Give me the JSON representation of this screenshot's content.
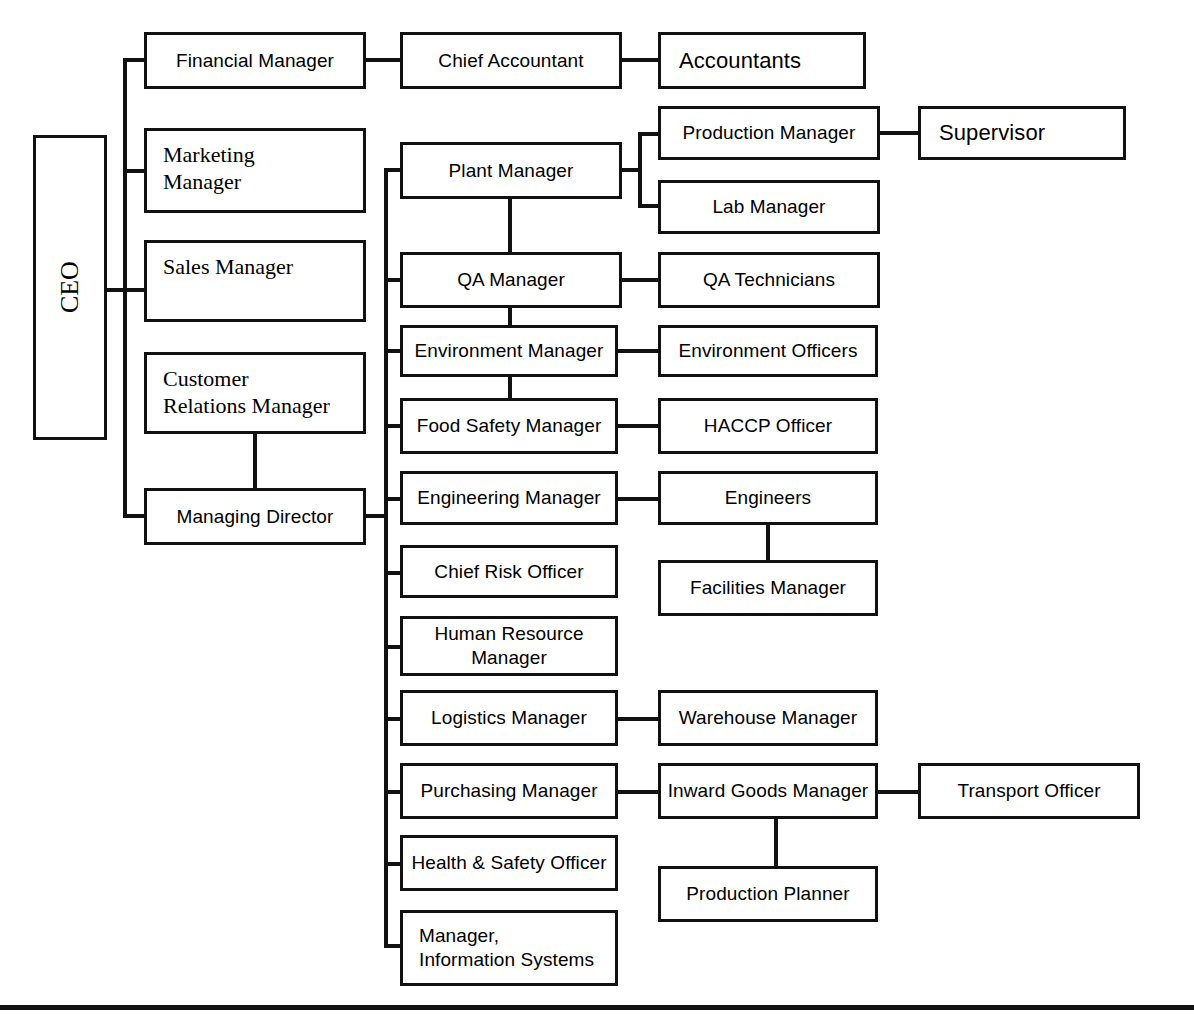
{
  "chart": {
    "type": "org-chart",
    "orientation": "left-to-right",
    "line_color": "#111111",
    "box_fill": "#ffffff",
    "page_rule_y": 1005
  },
  "nodes": {
    "ceo": {
      "label": "CEO",
      "x": 33,
      "y": 135,
      "w": 74,
      "h": 305
    },
    "financial_manager": {
      "label": "Financial Manager",
      "x": 144,
      "y": 32,
      "w": 222,
      "h": 57
    },
    "chief_accountant": {
      "label": "Chief Accountant",
      "x": 400,
      "y": 32,
      "w": 222,
      "h": 57
    },
    "accountants": {
      "label": "Accountants",
      "x": 658,
      "y": 32,
      "w": 208,
      "h": 57
    },
    "marketing_manager": {
      "label": "Marketing\nManager",
      "x": 144,
      "y": 128,
      "w": 222,
      "h": 85
    },
    "sales_manager": {
      "label": "Sales Manager",
      "x": 144,
      "y": 240,
      "w": 222,
      "h": 82
    },
    "customer_relations_manager": {
      "label": "Customer\nRelations Manager",
      "x": 144,
      "y": 352,
      "w": 222,
      "h": 82
    },
    "managing_director": {
      "label": "Managing Director",
      "x": 144,
      "y": 488,
      "w": 222,
      "h": 57
    },
    "plant_manager": {
      "label": "Plant Manager",
      "x": 400,
      "y": 142,
      "w": 222,
      "h": 57
    },
    "production_manager": {
      "label": "Production Manager",
      "x": 658,
      "y": 106,
      "w": 222,
      "h": 54
    },
    "supervisor": {
      "label": "Supervisor",
      "x": 918,
      "y": 106,
      "w": 208,
      "h": 54
    },
    "lab_manager": {
      "label": "Lab Manager",
      "x": 658,
      "y": 180,
      "w": 222,
      "h": 54
    },
    "qa_manager": {
      "label": "QA Manager",
      "x": 400,
      "y": 252,
      "w": 222,
      "h": 56
    },
    "qa_technicians": {
      "label": "QA Technicians",
      "x": 658,
      "y": 252,
      "w": 222,
      "h": 56
    },
    "environment_manager": {
      "label": "Environment Manager",
      "x": 400,
      "y": 325,
      "w": 218,
      "h": 52
    },
    "environment_officers": {
      "label": "Environment Officers",
      "x": 658,
      "y": 325,
      "w": 220,
      "h": 52
    },
    "food_safety_manager": {
      "label": "Food Safety Manager",
      "x": 400,
      "y": 398,
      "w": 218,
      "h": 56
    },
    "haccp_officer": {
      "label": "HACCP Officer",
      "x": 658,
      "y": 398,
      "w": 220,
      "h": 56
    },
    "engineering_manager": {
      "label": "Engineering Manager",
      "x": 400,
      "y": 471,
      "w": 218,
      "h": 54
    },
    "engineers": {
      "label": "Engineers",
      "x": 658,
      "y": 471,
      "w": 220,
      "h": 54
    },
    "facilities_manager": {
      "label": "Facilities Manager",
      "x": 658,
      "y": 560,
      "w": 220,
      "h": 56
    },
    "chief_risk_officer": {
      "label": "Chief Risk Officer",
      "x": 400,
      "y": 545,
      "w": 218,
      "h": 53
    },
    "human_resource_manager": {
      "label": "Human Resource\nManager",
      "x": 400,
      "y": 616,
      "w": 218,
      "h": 60
    },
    "logistics_manager": {
      "label": "Logistics Manager",
      "x": 400,
      "y": 690,
      "w": 218,
      "h": 56
    },
    "warehouse_manager": {
      "label": "Warehouse Manager",
      "x": 658,
      "y": 690,
      "w": 220,
      "h": 56
    },
    "purchasing_manager": {
      "label": "Purchasing Manager",
      "x": 400,
      "y": 763,
      "w": 218,
      "h": 56
    },
    "inward_goods_manager": {
      "label": "Inward Goods Manager",
      "x": 658,
      "y": 763,
      "w": 220,
      "h": 56
    },
    "transport_officer": {
      "label": "Transport Officer",
      "x": 918,
      "y": 763,
      "w": 222,
      "h": 56
    },
    "production_planner": {
      "label": "Production Planner",
      "x": 658,
      "y": 866,
      "w": 220,
      "h": 56
    },
    "health_safety_officer": {
      "label": "Health & Safety Officer",
      "x": 400,
      "y": 835,
      "w": 218,
      "h": 56
    },
    "manager_information_systems": {
      "label": "Manager,\nInformation Systems",
      "x": 400,
      "y": 910,
      "w": 218,
      "h": 76
    }
  },
  "hierarchy": {
    "ceo": [
      "financial_manager",
      "marketing_manager",
      "sales_manager",
      "managing_director"
    ],
    "financial_manager": [
      "chief_accountant"
    ],
    "chief_accountant": [
      "accountants"
    ],
    "customer_relations_manager": [
      "managing_director"
    ],
    "managing_director": [
      "plant_manager",
      "qa_manager",
      "environment_manager",
      "food_safety_manager",
      "engineering_manager",
      "chief_risk_officer",
      "human_resource_manager",
      "logistics_manager",
      "purchasing_manager",
      "health_safety_officer",
      "manager_information_systems"
    ],
    "plant_manager": [
      "production_manager",
      "lab_manager",
      "qa_manager"
    ],
    "production_manager": [
      "supervisor"
    ],
    "qa_manager": [
      "qa_technicians",
      "environment_manager"
    ],
    "environment_manager": [
      "environment_officers",
      "food_safety_manager"
    ],
    "food_safety_manager": [
      "haccp_officer"
    ],
    "engineering_manager": [
      "engineers"
    ],
    "engineers": [
      "facilities_manager"
    ],
    "logistics_manager": [
      "warehouse_manager"
    ],
    "purchasing_manager": [
      "inward_goods_manager"
    ],
    "inward_goods_manager": [
      "transport_officer",
      "production_planner"
    ]
  }
}
